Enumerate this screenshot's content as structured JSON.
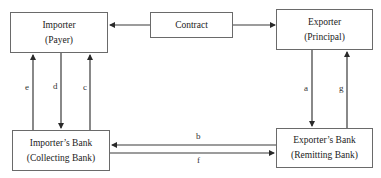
{
  "diagram": {
    "type": "flow",
    "nodes": {
      "importer": {
        "title": "Importer",
        "subtitle": "(Payer)"
      },
      "contract": {
        "title": "Contract"
      },
      "exporter": {
        "title": "Exporter",
        "subtitle": "(Principal)"
      },
      "importers_bank": {
        "title": "Importer’s Bank",
        "subtitle": "(Collecting Bank)"
      },
      "exporters_bank": {
        "title": "Exporter’s Bank",
        "subtitle": "(Remitting Bank)"
      }
    },
    "edges": [
      {
        "label": "",
        "from": "contract",
        "to": "importer"
      },
      {
        "label": "",
        "from": "contract",
        "to": "exporter"
      },
      {
        "label": "a",
        "from": "exporter",
        "to": "exporters_bank"
      },
      {
        "label": "b",
        "from": "exporters_bank",
        "to": "importers_bank"
      },
      {
        "label": "c",
        "from": "importers_bank",
        "to": "importer"
      },
      {
        "label": "d",
        "from": "importer",
        "to": "importers_bank"
      },
      {
        "label": "e",
        "from": "importers_bank",
        "to": "importer"
      },
      {
        "label": "f",
        "from": "importers_bank",
        "to": "exporters_bank"
      },
      {
        "label": "g",
        "from": "exporters_bank",
        "to": "exporter"
      }
    ],
    "labels": {
      "a": "a",
      "b": "b",
      "c": "c",
      "d": "d",
      "e": "e",
      "f": "f",
      "g": "g"
    },
    "colors": {
      "line": "#3a3a3a",
      "border": "#6a6a6a"
    }
  }
}
